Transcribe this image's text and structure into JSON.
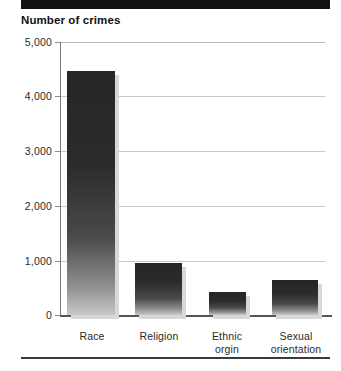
{
  "figure": {
    "title": "Number of crimes",
    "top_band": "decorative-black-band",
    "bottom_rule": "decorative-horizontal-rule"
  },
  "chart_data": {
    "type": "bar",
    "title": "Number of crimes",
    "xlabel": "",
    "ylabel": "Number of crimes",
    "categories": [
      "Race",
      "Religion",
      "Ethnic orgin",
      "Sexual orientation"
    ],
    "values": [
      4470,
      950,
      430,
      640
    ],
    "ylim": [
      0,
      5000
    ],
    "ytick_labels": [
      "0",
      "1,000",
      "2,000",
      "3,000",
      "4,000",
      "5,000"
    ],
    "ytick_values": [
      0,
      1000,
      2000,
      3000,
      4000,
      5000
    ],
    "grid": true,
    "grid_axis": "y",
    "legend": false,
    "bar_color": "#2b2b2b",
    "bar_gradient": "dark-top-to-light-bottom",
    "grid_color": "#c9c9c9",
    "axis_color": "#555555"
  },
  "axis": {
    "y_labels": [
      {
        "text": "5,000",
        "value": 5000
      },
      {
        "text": "4,000",
        "value": 4000
      },
      {
        "text": "3,000",
        "value": 3000
      },
      {
        "text": "2,000",
        "value": 2000
      },
      {
        "text": "1,000",
        "value": 1000
      },
      {
        "text": "0",
        "value": 0
      }
    ],
    "x_labels": [
      {
        "text": "Race"
      },
      {
        "text": "Religion"
      },
      {
        "text": "Ethnic\norgin"
      },
      {
        "text": "Sexual\norientation"
      }
    ]
  }
}
